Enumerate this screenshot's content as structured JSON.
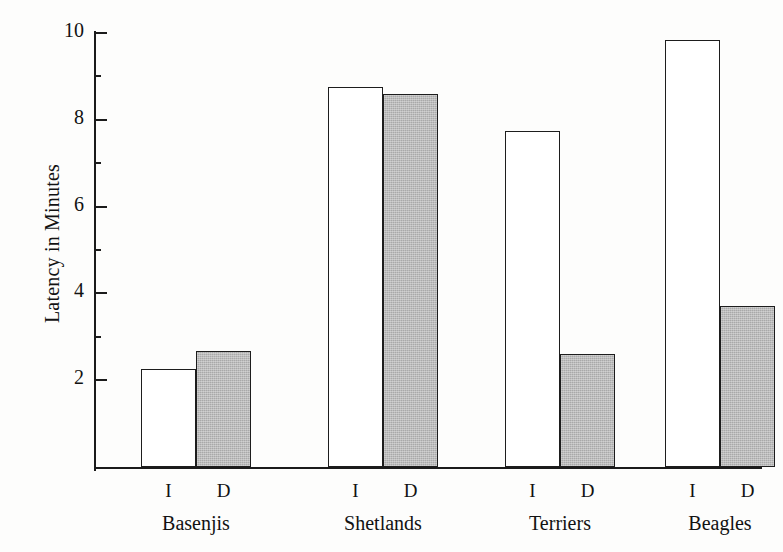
{
  "chart_data": {
    "type": "bar",
    "title": "",
    "xlabel": "",
    "ylabel": "Latency in Minutes",
    "ylim": [
      0,
      10
    ],
    "ytick_labels": [
      "2",
      "4",
      "6",
      "8",
      "10"
    ],
    "ytick_values": [
      2,
      4,
      6,
      8,
      10
    ],
    "minor_ytick_values": [
      3,
      5,
      7,
      9
    ],
    "grid": false,
    "legend_position": "none",
    "categories": [
      "Basenjis",
      "Shetlands",
      "Terriers",
      "Beagles"
    ],
    "condition_labels": [
      "I",
      "D"
    ],
    "series": [
      {
        "name": "I",
        "style": "open",
        "values": [
          2.25,
          8.75,
          7.75,
          9.85
        ]
      },
      {
        "name": "D",
        "style": "filled",
        "values": [
          2.68,
          8.6,
          2.6,
          3.7
        ]
      }
    ],
    "colors": {
      "open_fill": "#ffffff",
      "filled_fill": "#a9a9a9",
      "outline": "#1d1d1d",
      "axis": "#1b1b1b",
      "text": "#121212",
      "background": "#fdfdfc"
    }
  },
  "axis": {
    "y_title": "Latency in Minutes"
  },
  "groups": [
    {
      "label": "Basenjis",
      "bars": [
        {
          "condition": "I",
          "value": 2.25,
          "style": "open"
        },
        {
          "condition": "D",
          "value": 2.68,
          "style": "filled"
        }
      ]
    },
    {
      "label": "Shetlands",
      "bars": [
        {
          "condition": "I",
          "value": 8.75,
          "style": "open"
        },
        {
          "condition": "D",
          "value": 8.6,
          "style": "filled"
        }
      ]
    },
    {
      "label": "Terriers",
      "bars": [
        {
          "condition": "I",
          "value": 7.75,
          "style": "open"
        },
        {
          "condition": "D",
          "value": 2.6,
          "style": "filled"
        }
      ]
    },
    {
      "label": "Beagles",
      "bars": [
        {
          "condition": "I",
          "value": 9.85,
          "style": "open"
        },
        {
          "condition": "D",
          "value": 3.7,
          "style": "filled"
        }
      ]
    }
  ]
}
